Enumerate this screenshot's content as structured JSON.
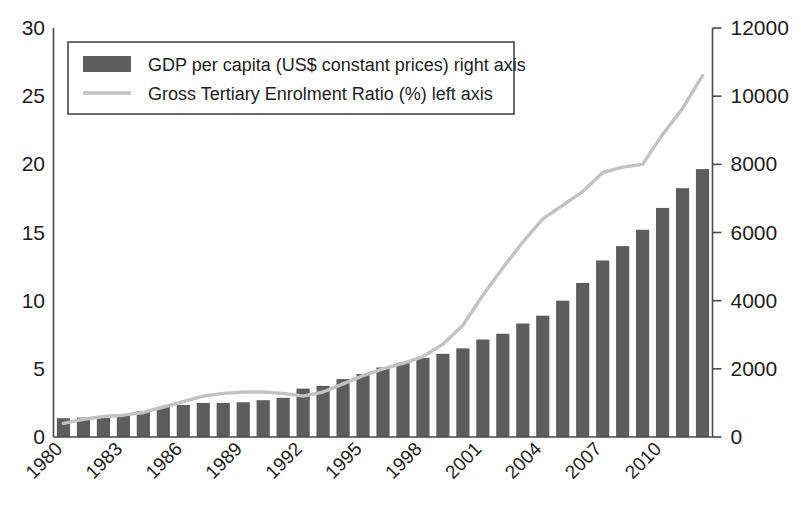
{
  "chart_data": {
    "type": "bar",
    "title": "",
    "subtitle": "",
    "xlabel": "",
    "ylabel": "",
    "y2label": "",
    "grid": false,
    "legend_position": "top-left",
    "x": [
      1980,
      1981,
      1982,
      1983,
      1984,
      1985,
      1986,
      1987,
      1988,
      1989,
      1990,
      1991,
      1992,
      1993,
      1994,
      1995,
      1996,
      1997,
      1998,
      1999,
      2000,
      2001,
      2002,
      2003,
      2004,
      2005,
      2006,
      2007,
      2008,
      2009,
      2010,
      2011,
      2012
    ],
    "categories": [
      "1980",
      "1981",
      "1982",
      "1983",
      "1984",
      "1985",
      "1986",
      "1987",
      "1988",
      "1989",
      "1990",
      "1991",
      "1992",
      "1993",
      "1994",
      "1995",
      "1996",
      "1997",
      "1998",
      "1999",
      "2000",
      "2001",
      "2002",
      "2003",
      "2004",
      "2005",
      "2006",
      "2007",
      "2008",
      "2009",
      "2010",
      "2011",
      "2012"
    ],
    "xtick_labels": [
      "1980",
      "1983",
      "1986",
      "1989",
      "1992",
      "1995",
      "1998",
      "2001",
      "2004",
      "2007",
      "2010"
    ],
    "xtick_values": [
      1980,
      1983,
      1986,
      1989,
      1992,
      1995,
      1998,
      2001,
      2004,
      2007,
      2010
    ],
    "xtick_rotation_deg": -45,
    "ylim": [
      0,
      30
    ],
    "ytick_values": [
      0,
      5,
      10,
      15,
      20,
      25,
      30
    ],
    "ytick_labels": [
      "0",
      "5",
      "10",
      "15",
      "20",
      "25",
      "30"
    ],
    "y2lim": [
      0,
      12000
    ],
    "y2tick_values": [
      0,
      2000,
      4000,
      6000,
      8000,
      10000,
      12000
    ],
    "y2tick_labels": [
      "0",
      "2000",
      "4000",
      "6000",
      "8000",
      "10000",
      "12000"
    ],
    "series": [
      {
        "name": "GDP per capita (US$ constant prices) right axis",
        "type": "bar",
        "axis": "right",
        "color": "#5d5d5d",
        "values": [
          550,
          570,
          600,
          640,
          760,
          880,
          940,
          1000,
          1000,
          1020,
          1080,
          1150,
          1420,
          1500,
          1700,
          1850,
          2040,
          2180,
          2320,
          2440,
          2600,
          2860,
          3030,
          3330,
          3560,
          4000,
          4520,
          5180,
          5600,
          6080,
          6720,
          7300,
          7860
        ]
      },
      {
        "name": "Gross Tertiary Enrolment Ratio (%) left axis",
        "type": "line",
        "axis": "left",
        "color": "#c2c2c2",
        "values": [
          1.0,
          1.3,
          1.5,
          1.6,
          1.8,
          2.2,
          2.6,
          3.0,
          3.2,
          3.3,
          3.3,
          3.2,
          3.0,
          3.3,
          3.9,
          4.5,
          5.0,
          5.4,
          5.9,
          6.8,
          8.2,
          10.4,
          12.4,
          14.3,
          16.0,
          17.0,
          18.0,
          19.4,
          19.8,
          20.0,
          22.2,
          24.1,
          26.5
        ]
      }
    ]
  },
  "legend": {
    "items": [
      {
        "swatch": "bar-swatch",
        "label": "GDP per capita (US$ constant prices) right axis"
      },
      {
        "swatch": "line-swatch",
        "label": "Gross Tertiary Enrolment Ratio (%) left axis"
      }
    ]
  },
  "axes": {
    "left_ticks": [
      "30",
      "25",
      "20",
      "15",
      "10",
      "5",
      "0"
    ],
    "right_ticks": [
      "12000",
      "10000",
      "8000",
      "6000",
      "4000",
      "2000",
      "0"
    ],
    "bottom_ticks": [
      "1980",
      "1983",
      "1986",
      "1989",
      "1992",
      "1995",
      "1998",
      "2001",
      "2004",
      "2007",
      "2010"
    ]
  },
  "colors": {
    "bar": "#5d5d5d",
    "line": "#c2c2c2",
    "axis": "#4a4a4a",
    "text": "#1d1d1d",
    "background": "#ffffff"
  }
}
